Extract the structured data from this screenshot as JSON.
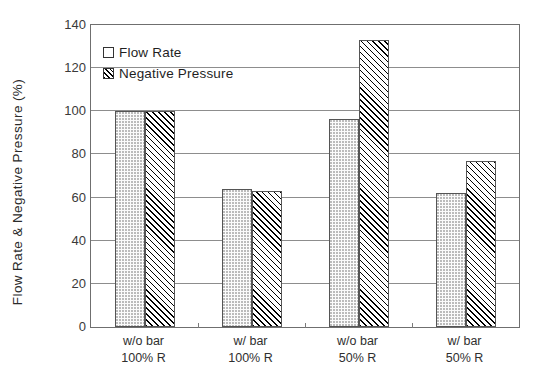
{
  "chart_data": {
    "type": "bar",
    "title": "",
    "xlabel": "",
    "ylabel": "Flow Rate & Negative Pressure (%)",
    "ylim": [
      0,
      140
    ],
    "ytick_values": [
      0,
      20,
      40,
      60,
      80,
      100,
      120,
      140
    ],
    "ytick_labels": [
      "0",
      "20",
      "40",
      "60",
      "80",
      "100",
      "120",
      "140"
    ],
    "grid": true,
    "grid_axis": "y",
    "legend_position": "upper-left-inside",
    "categories": [
      {
        "line1": "w/o bar",
        "line2": "100% R"
      },
      {
        "line1": "w/ bar",
        "line2": "100% R"
      },
      {
        "line1": "w/o bar",
        "line2": "50% R"
      },
      {
        "line1": "w/ bar",
        "line2": "50% R"
      }
    ],
    "category_labels": [
      "w/o bar 100% R",
      "w/ bar 100% R",
      "w/o bar 50% R",
      "w/ bar 50% R"
    ],
    "series": [
      {
        "name": "Flow Rate",
        "pattern": "dotted",
        "values": [
          100,
          64,
          96.5,
          62
        ]
      },
      {
        "name": "Negative Pressure",
        "pattern": "diagonal-hatch",
        "values": [
          100,
          63,
          133,
          77
        ]
      }
    ]
  },
  "legend": {
    "items": [
      {
        "label": "Flow Rate",
        "swatch": "dotted-square-icon"
      },
      {
        "label": "Negative Pressure",
        "swatch": "hatched-square-icon"
      }
    ]
  },
  "colors": {
    "axis": "#6f6f6f",
    "grid": "#8d8d8d",
    "bar_outline": "#555555",
    "text": "#2b2b2b",
    "background": "#ffffff"
  }
}
